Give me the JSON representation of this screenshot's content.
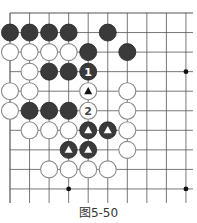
{
  "caption": "图5-50",
  "board": {
    "origin_x": 10,
    "origin_y": 13,
    "spacing": 19.55,
    "cols": 10,
    "rows": 10,
    "line_color": "#555555",
    "stone_radius": 8.5,
    "black_color": "#3a3a3a",
    "white_stroke": "#8a8a8a",
    "star_points": [
      [
        9,
        3
      ],
      [
        3,
        9
      ],
      [
        9,
        9
      ]
    ],
    "stones": [
      {
        "c": 0,
        "r": 1,
        "color": "black"
      },
      {
        "c": 1,
        "r": 1,
        "color": "black"
      },
      {
        "c": 2,
        "r": 1,
        "color": "black"
      },
      {
        "c": 3,
        "r": 1,
        "color": "black"
      },
      {
        "c": 5,
        "r": 1,
        "color": "black"
      },
      {
        "c": 0,
        "r": 2,
        "color": "white"
      },
      {
        "c": 1,
        "r": 2,
        "color": "white"
      },
      {
        "c": 2,
        "r": 2,
        "color": "white"
      },
      {
        "c": 3,
        "r": 2,
        "color": "white"
      },
      {
        "c": 4,
        "r": 2,
        "color": "black"
      },
      {
        "c": 6,
        "r": 2,
        "color": "black"
      },
      {
        "c": 1,
        "r": 3,
        "color": "white"
      },
      {
        "c": 2,
        "r": 3,
        "color": "black"
      },
      {
        "c": 3,
        "r": 3,
        "color": "black"
      },
      {
        "c": 4,
        "r": 3,
        "color": "black",
        "label": "1"
      },
      {
        "c": 0,
        "r": 4,
        "color": "white"
      },
      {
        "c": 1,
        "r": 4,
        "color": "white"
      },
      {
        "c": 4,
        "r": 4,
        "color": "white",
        "mark": "triangle"
      },
      {
        "c": 6,
        "r": 4,
        "color": "white"
      },
      {
        "c": 0,
        "r": 5,
        "color": "white"
      },
      {
        "c": 1,
        "r": 5,
        "color": "black"
      },
      {
        "c": 2,
        "r": 5,
        "color": "black"
      },
      {
        "c": 3,
        "r": 5,
        "color": "black"
      },
      {
        "c": 4,
        "r": 5,
        "color": "white",
        "label": "2"
      },
      {
        "c": 6,
        "r": 5,
        "color": "white"
      },
      {
        "c": 1,
        "r": 6,
        "color": "white"
      },
      {
        "c": 2,
        "r": 6,
        "color": "white"
      },
      {
        "c": 3,
        "r": 6,
        "color": "white"
      },
      {
        "c": 4,
        "r": 6,
        "color": "black",
        "mark": "triangle"
      },
      {
        "c": 5,
        "r": 6,
        "color": "black",
        "mark": "triangle"
      },
      {
        "c": 6,
        "r": 6,
        "color": "white"
      },
      {
        "c": 3,
        "r": 7,
        "color": "black",
        "mark": "triangle"
      },
      {
        "c": 4,
        "r": 7,
        "color": "black",
        "mark": "triangle"
      },
      {
        "c": 6,
        "r": 7,
        "color": "white"
      },
      {
        "c": 2,
        "r": 8,
        "color": "white"
      },
      {
        "c": 3,
        "r": 8,
        "color": "white"
      },
      {
        "c": 4,
        "r": 8,
        "color": "white"
      },
      {
        "c": 5,
        "r": 8,
        "color": "white"
      }
    ]
  }
}
